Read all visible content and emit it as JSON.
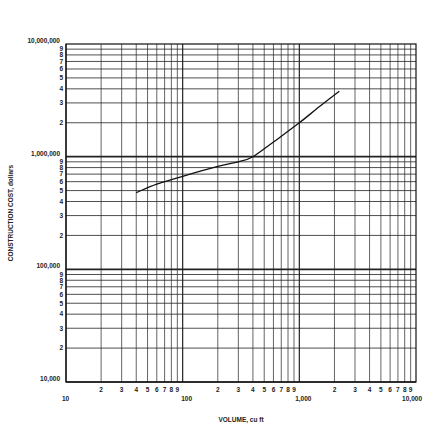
{
  "chart_data": {
    "type": "line",
    "title": "",
    "xlabel": "VOLUME, cu ft",
    "ylabel": "CONSTRUCTION COST, dollars",
    "xscale": "log",
    "yscale": "log",
    "xlim": [
      10,
      10000
    ],
    "ylim": [
      10000,
      10000000
    ],
    "grid": true,
    "legend": null,
    "x_major_tick_labels": [
      "10",
      "100",
      "1,000",
      "10,000"
    ],
    "x_minor_tick_labels": [
      "2",
      "3",
      "4",
      "5",
      "6",
      "7",
      "8",
      "9"
    ],
    "y_major_tick_labels": [
      "10,000",
      "100,000",
      "1,000,000",
      "10,000,000"
    ],
    "y_minor_tick_labels": [
      "2",
      "3",
      "4",
      "5",
      "6",
      "7",
      "8",
      "9"
    ],
    "series": [
      {
        "name": "Construction cost",
        "x": [
          40,
          60,
          100,
          200,
          300,
          400,
          600,
          1000,
          1500,
          2200
        ],
        "y": [
          480000,
          570000,
          670000,
          820000,
          900000,
          1000000,
          1350000,
          2000000,
          2800000,
          3800000
        ]
      }
    ]
  },
  "caption": "Figure (partially visible, illegible)"
}
